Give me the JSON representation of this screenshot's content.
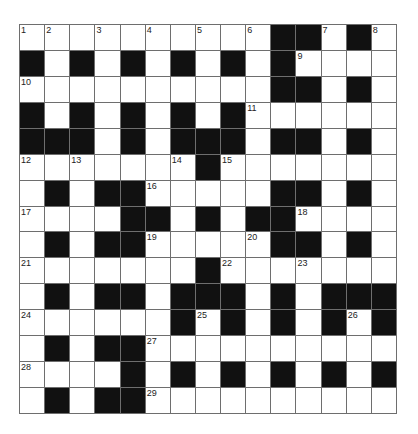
{
  "puzzle": {
    "rows": 15,
    "cols": 15,
    "colors": {
      "block": "#111111",
      "cell": "#ffffff",
      "line": "#6e6e6e"
    },
    "grid": [
      "...........##.#.",
      "x"
    ],
    "layout": [
      "WWWWWWWWWWBBWBW",
      "BWBWBWBWBWBWWWW",
      "WWWWWWWWWWBBWBW",
      "BWBWBWBWBWWWWWW",
      "BBBWBWBBBWBBWBW",
      "WWWWWWWBWWWWWWW",
      "WBWBBWWWWWBBWBW",
      "WWWWBBWBWBBWWWW",
      "WBWBBWWWWWBBWBW",
      "WWWWWWWBWWWWWWW",
      "WBWBBWBBBWBWBBB",
      "WWWWWWBWBWBWBWB",
      "WBWBBWWWWWWWWWW",
      "WWWWBWBWBWBWBWB",
      "WBWBBWWWWWWWWWW"
    ],
    "numbers": [
      {
        "r": 0,
        "c": 0,
        "n": "1"
      },
      {
        "r": 0,
        "c": 1,
        "n": "2"
      },
      {
        "r": 0,
        "c": 3,
        "n": "3"
      },
      {
        "r": 0,
        "c": 5,
        "n": "4"
      },
      {
        "r": 0,
        "c": 7,
        "n": "5"
      },
      {
        "r": 0,
        "c": 9,
        "n": "6"
      },
      {
        "r": 0,
        "c": 12,
        "n": "7"
      },
      {
        "r": 0,
        "c": 14,
        "n": "8"
      },
      {
        "r": 1,
        "c": 11,
        "n": "9"
      },
      {
        "r": 2,
        "c": 0,
        "n": "10"
      },
      {
        "r": 3,
        "c": 9,
        "n": "11"
      },
      {
        "r": 5,
        "c": 0,
        "n": "12"
      },
      {
        "r": 5,
        "c": 2,
        "n": "13"
      },
      {
        "r": 5,
        "c": 6,
        "n": "14"
      },
      {
        "r": 5,
        "c": 8,
        "n": "15"
      },
      {
        "r": 6,
        "c": 5,
        "n": "16"
      },
      {
        "r": 7,
        "c": 0,
        "n": "17"
      },
      {
        "r": 7,
        "c": 11,
        "n": "18"
      },
      {
        "r": 8,
        "c": 5,
        "n": "19"
      },
      {
        "r": 8,
        "c": 9,
        "n": "20"
      },
      {
        "r": 9,
        "c": 0,
        "n": "21"
      },
      {
        "r": 9,
        "c": 8,
        "n": "22"
      },
      {
        "r": 9,
        "c": 11,
        "n": "23"
      },
      {
        "r": 11,
        "c": 0,
        "n": "24"
      },
      {
        "r": 11,
        "c": 7,
        "n": "25"
      },
      {
        "r": 11,
        "c": 13,
        "n": "26"
      },
      {
        "r": 12,
        "c": 5,
        "n": "27"
      },
      {
        "r": 13,
        "c": 0,
        "n": "28"
      },
      {
        "r": 14,
        "c": 5,
        "n": "29"
      }
    ]
  }
}
